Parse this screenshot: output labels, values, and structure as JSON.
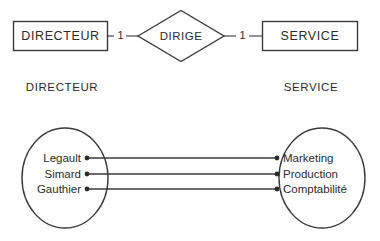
{
  "diagram": {
    "stroke_color": "#3a3a3a",
    "text_color": "#2b2b2b",
    "background_color": "#ffffff"
  },
  "conceptual": {
    "left_entity": {
      "label": "DIRECTEUR",
      "cardinality": "1"
    },
    "relationship": {
      "label": "DIRIGE"
    },
    "right_entity": {
      "label": "SERVICE",
      "cardinality": "1"
    }
  },
  "captions": {
    "left": "DIRECTEUR",
    "right": "SERVICE"
  },
  "instances": {
    "left_set": {
      "members": [
        "Legault",
        "Simard",
        "Gauthier"
      ]
    },
    "right_set": {
      "members": [
        "Marketing",
        "Production",
        "Comptabilité"
      ]
    },
    "mappings": [
      {
        "from": "Legault",
        "to": "Marketing"
      },
      {
        "from": "Simard",
        "to": "Production"
      },
      {
        "from": "Gauthier",
        "to": "Comptabilité"
      }
    ]
  }
}
